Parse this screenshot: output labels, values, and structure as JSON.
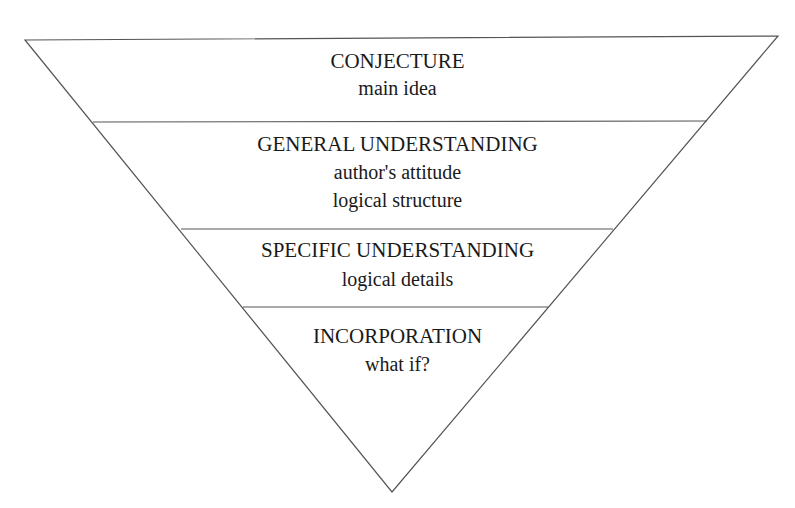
{
  "diagram": {
    "type": "inverted-pyramid",
    "line_color": "#555555",
    "levels": [
      {
        "title": "CONJECTURE",
        "items": [
          "main idea"
        ]
      },
      {
        "title": "GENERAL UNDERSTANDING",
        "items": [
          "author's attitude",
          "logical structure"
        ]
      },
      {
        "title": "SPECIFIC UNDERSTANDING",
        "items": [
          "logical details"
        ]
      },
      {
        "title": "INCORPORATION",
        "items": [
          "what if?"
        ]
      }
    ]
  }
}
